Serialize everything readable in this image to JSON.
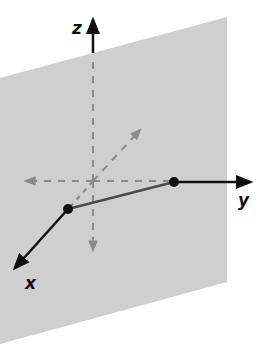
{
  "diagram": {
    "type": "3d-coordinate-plane",
    "colors": {
      "plane": "#cfcfcf",
      "axis": "#111111",
      "hidden_axis": "#8a8a8a",
      "segment": "#4a4a4a",
      "point": "#111111",
      "background": "#ffffff"
    },
    "plane": {
      "corners": [
        [
          0,
          78
        ],
        [
          227,
          17
        ],
        [
          227,
          282
        ],
        [
          0,
          344
        ]
      ]
    },
    "origin": [
      93,
      181
    ],
    "axes": {
      "z": {
        "label": "z",
        "tip": [
          93,
          18
        ],
        "visible_from": [
          93,
          53
        ],
        "label_pos": [
          72,
          33
        ]
      },
      "y": {
        "label": "y",
        "tip": [
          252,
          182
        ],
        "visible_from": [
          174,
          182
        ],
        "label_pos": [
          238,
          205
        ]
      },
      "x": {
        "label": "x",
        "tip": [
          13,
          270
        ],
        "visible_from": [
          68,
          209
        ],
        "label_pos": [
          26,
          287
        ]
      }
    },
    "points": [
      {
        "name": "x-intercept",
        "pos": [
          68,
          209
        ]
      },
      {
        "name": "y-intercept",
        "pos": [
          174,
          182
        ]
      }
    ]
  }
}
